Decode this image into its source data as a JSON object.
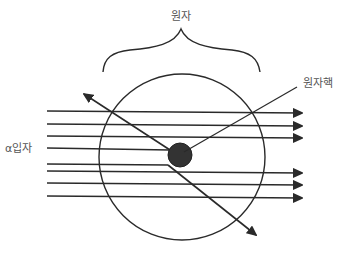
{
  "labels": {
    "atom": "원자",
    "nucleus": "원자핵",
    "alpha_particle": "α입자"
  },
  "colors": {
    "line": "#2a2a2a",
    "nucleus_fill": "#333333",
    "label_text": "#555555",
    "background": "#ffffff"
  },
  "paths": {
    "undeflected_count": 6,
    "deflected_count": 2,
    "deflections": [
      "back-scattered upward-left",
      "scattered downward-right"
    ]
  }
}
